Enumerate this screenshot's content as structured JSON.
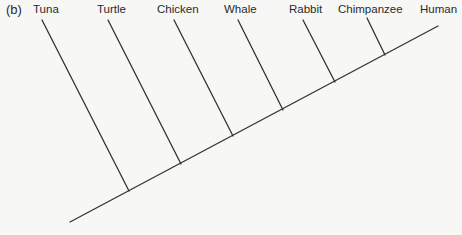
{
  "diagram": {
    "type": "cladogram",
    "panel_label": "(b)",
    "taxa": [
      "Tuna",
      "Turtle",
      "Chicken",
      "Whale",
      "Rabbit",
      "Chimpanzee",
      "Human"
    ],
    "line_color": "#333333",
    "background": "#f7f7f5"
  }
}
